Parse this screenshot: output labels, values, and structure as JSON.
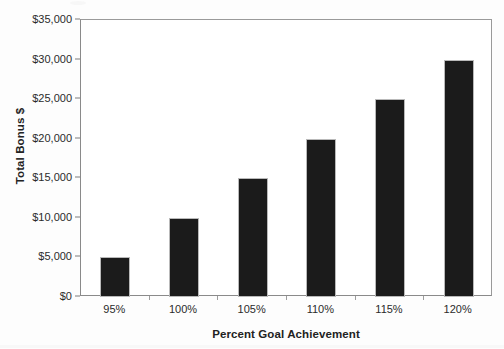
{
  "chart_data": {
    "type": "bar",
    "title": "",
    "categories": [
      "95%",
      "100%",
      "105%",
      "110%",
      "115%",
      "120%"
    ],
    "values": [
      5000,
      10000,
      15000,
      20000,
      25000,
      30000
    ],
    "value_labels": [
      "$5,000",
      "$10,000",
      "$15,000",
      "$20,000",
      "$25,000",
      "$30,000"
    ],
    "xlabel": "Percent Goal Achievement",
    "ylabel": "Total Bonus $",
    "ylim": [
      0,
      35000
    ],
    "ytick_values": [
      0,
      5000,
      10000,
      15000,
      20000,
      25000,
      30000,
      35000
    ],
    "ytick_labels": [
      "$0",
      "$5,000",
      "$10,000",
      "$15,000",
      "$20,000",
      "$25,000",
      "$30,000",
      "$35,000"
    ],
    "grid": false,
    "legend": false,
    "bar_color": "#1b1b1b",
    "bar_edge_color": "#b9b9b9",
    "axis_color": "#8a8a8a",
    "background_color": "#ffffff"
  }
}
